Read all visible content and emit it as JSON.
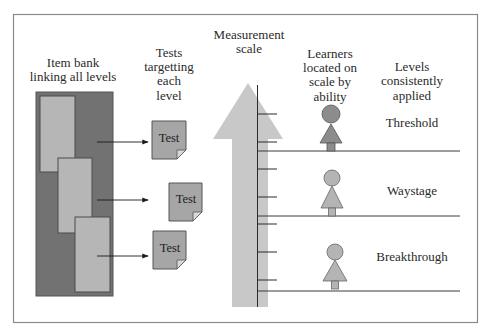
{
  "diagram": {
    "headings": {
      "item_bank": [
        "Item bank",
        "linking all levels"
      ],
      "tests": [
        "Tests",
        "targetting",
        "each",
        "level"
      ],
      "scale": [
        "Measurement",
        "scale"
      ],
      "learners": [
        "Learners",
        "located on",
        "scale by",
        "ability"
      ],
      "levels": [
        "Levels",
        "consistently",
        "applied"
      ]
    },
    "tests": [
      {
        "label": "Test"
      },
      {
        "label": "Test"
      },
      {
        "label": "Test"
      }
    ],
    "levels": [
      {
        "label": "Threshold"
      },
      {
        "label": "Waystage"
      },
      {
        "label": "Breakthrough"
      }
    ],
    "colors": {
      "item_bank": "#727272",
      "item_card": "#b6b6b6",
      "test_paper": "#a6a6a6",
      "scale_arrow": "#c8c8c8",
      "learner_highlight": "#8c8c8c",
      "learner": "#b4b4b4",
      "frame": "#8a8a8a"
    }
  }
}
